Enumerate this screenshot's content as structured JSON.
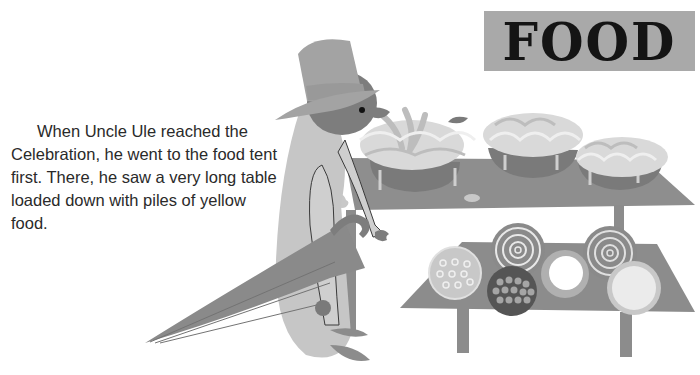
{
  "page": {
    "title": "FOOD",
    "story": "When Uncle Ule reached the Celebration, he went to the food tent first. There, he saw a very long table loaded down with piles of yellow food."
  },
  "illustration": {
    "character": "Uncle Ule",
    "items": [
      "top-hat",
      "umbrella",
      "long-table",
      "small-table",
      "food-baskets",
      "pies"
    ]
  },
  "colors": {
    "title_bg": "#a9a9a9",
    "title_text": "#141414",
    "table": "#8c8c8c",
    "body": "#c4c4c4",
    "hat": "#a3a3a3",
    "umbrella": "#8a8a8a",
    "head": "#7d7d7d"
  }
}
